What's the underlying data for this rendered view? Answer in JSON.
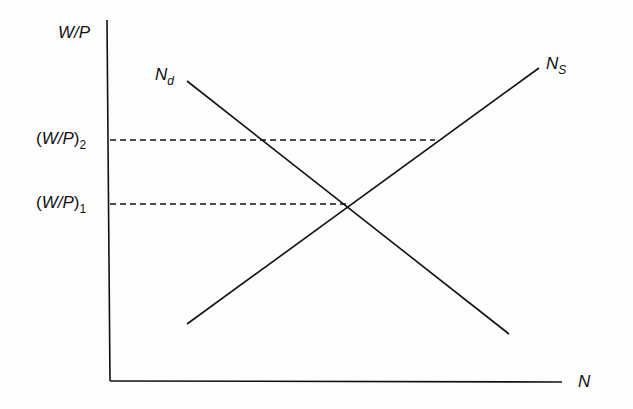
{
  "diagram": {
    "y_axis_label": "W/P",
    "x_axis_label": "N",
    "levels": [
      {
        "label_main": "W/P",
        "label_sub": "2",
        "y": 140
      },
      {
        "label_main": "W/P",
        "label_sub": "1",
        "y": 204
      }
    ],
    "curves": [
      {
        "name": "N",
        "sub": "d",
        "description": "labor demand (downward sloping)"
      },
      {
        "name": "N",
        "sub": "S",
        "description": "labor supply (upward sloping)"
      }
    ],
    "colors": {
      "line": "#111111",
      "background": "#fdfdfd"
    }
  }
}
